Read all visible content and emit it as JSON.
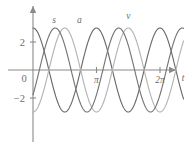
{
  "chart_data": {
    "type": "line",
    "title": "",
    "xlabel": "t",
    "ylabel": "",
    "xlim": [
      -0.3,
      7.6
    ],
    "ylim": [
      -4.2,
      4.2
    ],
    "grid": false,
    "legend_position": "inline-curve-labels",
    "x_ticks": [
      {
        "value": 3.14159,
        "label": "π"
      },
      {
        "value": 6.28319,
        "label": "2π"
      }
    ],
    "y_ticks": [
      {
        "value": 2,
        "label": "2"
      },
      {
        "value": -2,
        "label": "−2"
      }
    ],
    "origin_label": "0",
    "amplitude": 3,
    "period": 3.14159,
    "series": [
      {
        "name": "s",
        "label": "s",
        "color": "#6b6b6b",
        "formula": "3*cos(2t)",
        "phase": 0,
        "label_x": 1.05,
        "label_y": 3.35,
        "points_x": [
          0,
          0.3927,
          0.7854,
          1.1781,
          1.5708,
          1.9635,
          2.3562,
          2.7489,
          3.1416,
          3.5343,
          3.927,
          4.3197,
          4.7124,
          5.1051,
          5.4978,
          5.8905,
          6.2832,
          6.6759,
          7.0686
        ],
        "points_y": [
          3,
          2.121,
          0,
          -2.121,
          -3,
          -2.121,
          0,
          2.121,
          3,
          2.121,
          0,
          -2.121,
          -3,
          -2.121,
          0,
          2.121,
          3,
          2.121,
          0
        ]
      },
      {
        "name": "a",
        "label": "a",
        "color": "#b4b4b4",
        "formula": "-3*cos(2t)",
        "phase": 3.14159,
        "label_x": 2.3,
        "label_y": 3.35,
        "points_x": [
          0,
          0.3927,
          0.7854,
          1.1781,
          1.5708,
          1.9635,
          2.3562,
          2.7489,
          3.1416,
          3.5343,
          3.927,
          4.3197,
          4.7124,
          5.1051,
          5.4978,
          5.8905,
          6.2832,
          6.6759,
          7.0686
        ],
        "points_y": [
          -3,
          -2.121,
          0,
          2.121,
          3,
          2.121,
          0,
          -2.121,
          -3,
          -2.121,
          0,
          2.121,
          3,
          2.121,
          0,
          -2.121,
          -3,
          -2.121,
          0
        ]
      },
      {
        "name": "v",
        "label": "v",
        "color": "#767676",
        "formula": "3*cos(2t - 2.2)",
        "phase": 2.2,
        "label_x": 4.72,
        "label_y": 3.65,
        "points_x": [
          0,
          0.3927,
          0.7854,
          1.1781,
          1.5708,
          1.9635,
          2.3562,
          2.7489,
          3.1416,
          3.5343,
          3.927,
          4.3197,
          4.7124,
          5.1051,
          5.4978,
          5.8905,
          6.2832,
          6.6759,
          7.0686
        ],
        "points_y": [
          -1.77,
          -2.95,
          -2.42,
          -0.66,
          1.41,
          2.86,
          2.77,
          1.25,
          -0.84,
          -2.53,
          -3.0,
          -1.93,
          0.09,
          1.98,
          2.99,
          2.58,
          1.0,
          -1.07,
          -2.66
        ]
      }
    ]
  },
  "axes": {
    "x_axis_name": "time-axis",
    "y_axis_name": "value-axis",
    "x_axis_label": "t",
    "origin_label": "0"
  }
}
